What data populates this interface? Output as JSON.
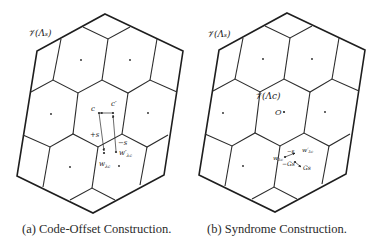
{
  "figure": {
    "panels": [
      {
        "id": "a",
        "caption": "(a) Code-Offset Construction.",
        "region_label": "𝒱(Λₛ)",
        "vector_labels": {
          "c": "c",
          "c_prime": "c′",
          "plus_s": "+s",
          "minus_s": "−s",
          "w": "w",
          "w_sub": "λc",
          "w_prime": "w′",
          "w_prime_sub": "λc"
        }
      },
      {
        "id": "b",
        "caption": "(b) Syndrome Construction.",
        "region_label": "𝒱(Λₛ)",
        "inner_region_label": "𝒱(Λc)",
        "origin_label": "O",
        "vector_labels": {
          "w": "w",
          "w_sub": "λc",
          "w_prime": "w′",
          "w_prime_sub": "λc",
          "minus_s": "−s",
          "minus_Gs": "−Gs",
          "Gs": "Gs"
        }
      }
    ]
  }
}
